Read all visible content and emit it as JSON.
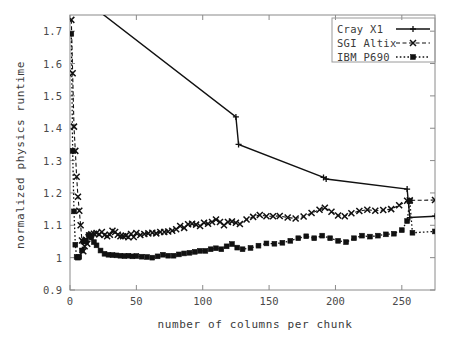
{
  "chart_data": {
    "type": "line",
    "title": "",
    "xlabel": "number of columns per chunk",
    "ylabel": "normalized physics runtime",
    "xlim": [
      0,
      275
    ],
    "ylim": [
      0.9,
      1.75
    ],
    "xticks": [
      0,
      50,
      100,
      150,
      200,
      250
    ],
    "xtick_labels": [
      "0",
      "50",
      "100",
      "150",
      "200",
      "250"
    ],
    "yticks": [
      0.9,
      1.0,
      1.1,
      1.2,
      1.3,
      1.4,
      1.5,
      1.6,
      1.7
    ],
    "ytick_labels": [
      "0.9",
      "1",
      "1.1",
      "1.2",
      "1.3",
      "1.4",
      "1.5",
      "1.6",
      "1.7"
    ],
    "grid": false,
    "legend_position": "top-right",
    "series": [
      {
        "name": "Cray X1",
        "style": "solid",
        "marker": "plus",
        "color": "#111111",
        "points": [
          [
            1,
            3.3
          ],
          [
            2,
            2.62
          ],
          [
            3,
            2.3
          ],
          [
            4,
            2.1
          ],
          [
            6,
            1.92
          ],
          [
            8,
            1.84
          ],
          [
            16,
            1.78
          ],
          [
            125,
            1.435
          ],
          [
            127,
            1.35
          ],
          [
            191,
            1.248
          ],
          [
            193,
            1.243
          ],
          [
            254,
            1.212
          ],
          [
            256,
            1.124
          ],
          [
            275,
            1.128
          ]
        ]
      },
      {
        "name": "SGI Altix",
        "style": "dashed",
        "marker": "cross",
        "color": "#111111",
        "points": [
          [
            1,
            1.735
          ],
          [
            2,
            1.57
          ],
          [
            3,
            1.405
          ],
          [
            4,
            1.33
          ],
          [
            5,
            1.25
          ],
          [
            6,
            1.188
          ],
          [
            7,
            1.145
          ],
          [
            8,
            1.1
          ],
          [
            9,
            1.053
          ],
          [
            10,
            1.02
          ],
          [
            11,
            1.035
          ],
          [
            12,
            1.055
          ],
          [
            13,
            1.043
          ],
          [
            14,
            1.063
          ],
          [
            16,
            1.072
          ],
          [
            18,
            1.074
          ],
          [
            20,
            1.076
          ],
          [
            22,
            1.072
          ],
          [
            24,
            1.079
          ],
          [
            26,
            1.07
          ],
          [
            28,
            1.066
          ],
          [
            30,
            1.071
          ],
          [
            32,
            1.083
          ],
          [
            34,
            1.079
          ],
          [
            36,
            1.071
          ],
          [
            38,
            1.066
          ],
          [
            40,
            1.066
          ],
          [
            42,
            1.068
          ],
          [
            44,
            1.063
          ],
          [
            46,
            1.073
          ],
          [
            48,
            1.064
          ],
          [
            50,
            1.076
          ],
          [
            53,
            1.07
          ],
          [
            56,
            1.073
          ],
          [
            59,
            1.075
          ],
          [
            62,
            1.077
          ],
          [
            65,
            1.075
          ],
          [
            68,
            1.079
          ],
          [
            71,
            1.079
          ],
          [
            74,
            1.081
          ],
          [
            77,
            1.083
          ],
          [
            80,
            1.088
          ],
          [
            83,
            1.098
          ],
          [
            86,
            1.092
          ],
          [
            89,
            1.103
          ],
          [
            92,
            1.105
          ],
          [
            95,
            1.102
          ],
          [
            98,
            1.098
          ],
          [
            101,
            1.108
          ],
          [
            104,
            1.105
          ],
          [
            107,
            1.11
          ],
          [
            110,
            1.118
          ],
          [
            113,
            1.11
          ],
          [
            116,
            1.1
          ],
          [
            119,
            1.11
          ],
          [
            122,
            1.112
          ],
          [
            125,
            1.108
          ],
          [
            128,
            1.104
          ],
          [
            133,
            1.118
          ],
          [
            138,
            1.126
          ],
          [
            143,
            1.132
          ],
          [
            148,
            1.128
          ],
          [
            153,
            1.128
          ],
          [
            158,
            1.129
          ],
          [
            164,
            1.124
          ],
          [
            170,
            1.121
          ],
          [
            176,
            1.127
          ],
          [
            182,
            1.138
          ],
          [
            188,
            1.148
          ],
          [
            192,
            1.154
          ],
          [
            197,
            1.142
          ],
          [
            202,
            1.13
          ],
          [
            207,
            1.128
          ],
          [
            212,
            1.137
          ],
          [
            218,
            1.144
          ],
          [
            224,
            1.148
          ],
          [
            230,
            1.145
          ],
          [
            236,
            1.147
          ],
          [
            242,
            1.15
          ],
          [
            248,
            1.162
          ],
          [
            254,
            1.176
          ],
          [
            256,
            1.177
          ],
          [
            275,
            1.178
          ]
        ]
      },
      {
        "name": "IBM P690",
        "style": "dotted",
        "marker": "square",
        "color": "#111111",
        "points": [
          [
            1,
            1.692
          ],
          [
            2,
            1.33
          ],
          [
            3,
            1.143
          ],
          [
            4,
            1.04
          ],
          [
            5,
            1.002
          ],
          [
            6,
            1.0
          ],
          [
            7,
            1.002
          ],
          [
            9,
            1.022
          ],
          [
            10,
            1.05
          ],
          [
            11,
            1.052
          ],
          [
            12,
            1.05
          ],
          [
            14,
            1.07
          ],
          [
            16,
            1.063
          ],
          [
            18,
            1.048
          ],
          [
            20,
            1.038
          ],
          [
            23,
            1.022
          ],
          [
            26,
            1.012
          ],
          [
            29,
            1.009
          ],
          [
            32,
            1.008
          ],
          [
            35,
            1.007
          ],
          [
            38,
            1.006
          ],
          [
            41,
            1.005
          ],
          [
            44,
            1.006
          ],
          [
            47,
            1.004
          ],
          [
            50,
            1.005
          ],
          [
            54,
            1.003
          ],
          [
            58,
            1.002
          ],
          [
            62,
            1.0
          ],
          [
            66,
            1.004
          ],
          [
            70,
            1.009
          ],
          [
            74,
            1.006
          ],
          [
            78,
            1.006
          ],
          [
            82,
            1.01
          ],
          [
            86,
            1.013
          ],
          [
            90,
            1.015
          ],
          [
            94,
            1.018
          ],
          [
            98,
            1.021
          ],
          [
            102,
            1.021
          ],
          [
            106,
            1.026
          ],
          [
            110,
            1.029
          ],
          [
            114,
            1.026
          ],
          [
            118,
            1.035
          ],
          [
            122,
            1.042
          ],
          [
            126,
            1.031
          ],
          [
            130,
            1.026
          ],
          [
            136,
            1.03
          ],
          [
            142,
            1.037
          ],
          [
            148,
            1.044
          ],
          [
            154,
            1.043
          ],
          [
            160,
            1.046
          ],
          [
            166,
            1.052
          ],
          [
            172,
            1.06
          ],
          [
            178,
            1.066
          ],
          [
            184,
            1.06
          ],
          [
            190,
            1.068
          ],
          [
            196,
            1.06
          ],
          [
            202,
            1.052
          ],
          [
            208,
            1.048
          ],
          [
            214,
            1.06
          ],
          [
            220,
            1.068
          ],
          [
            226,
            1.065
          ],
          [
            232,
            1.068
          ],
          [
            238,
            1.072
          ],
          [
            244,
            1.074
          ],
          [
            250,
            1.085
          ],
          [
            254,
            1.113
          ],
          [
            256,
            1.175
          ],
          [
            258,
            1.077
          ],
          [
            275,
            1.081
          ]
        ]
      }
    ]
  },
  "legend": {
    "entries": [
      {
        "label": "Cray X1"
      },
      {
        "label": "SGI Altix"
      },
      {
        "label": "IBM P690"
      }
    ]
  }
}
